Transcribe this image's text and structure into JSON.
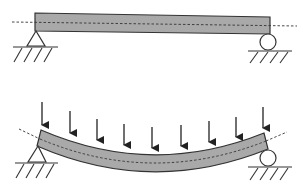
{
  "diagram": {
    "title": "",
    "panels": [
      {
        "id": "unloaded",
        "description": "Simply supported beam, unloaded (straight)",
        "beam_fill": "#a9a9a9"
      },
      {
        "id": "loaded",
        "description": "Simply supported beam under distributed load (bent/sagging)",
        "beam_fill": "#a9a9a9",
        "load_arrow_count": 9
      }
    ],
    "supports": {
      "left": "pin",
      "right": "roller"
    },
    "colors": {
      "beam": "#a9a9a9",
      "stroke": "#333333",
      "background": "#ffffff"
    }
  }
}
